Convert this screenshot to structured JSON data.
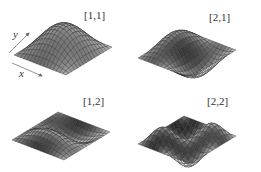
{
  "figure": {
    "panels": [
      {
        "label": "[1,1]",
        "mode": [
          1,
          1
        ]
      },
      {
        "label": "[2,1]",
        "mode": [
          2,
          1
        ]
      },
      {
        "label": "[1,2]",
        "mode": [
          1,
          2
        ]
      },
      {
        "label": "[2,2]",
        "mode": [
          2,
          2
        ]
      }
    ],
    "axes": {
      "x": "x",
      "y": "y"
    }
  }
}
